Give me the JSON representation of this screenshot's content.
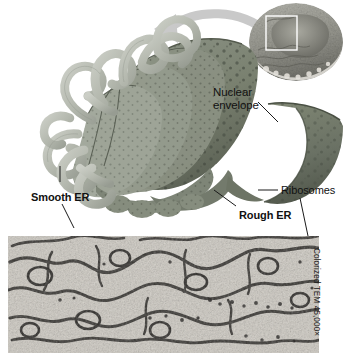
{
  "figure": {
    "background_color": "#ffffff",
    "labels": {
      "nuclear_envelope_line1": "Nuclear",
      "nuclear_envelope_line2": "envelope",
      "smooth_er": "Smooth ER",
      "rough_er": "Rough ER",
      "ribosomes": "Ribosomes"
    },
    "credit": "Colorized TEM 45,000×",
    "colors": {
      "rough_er_membrane": "#7d8477",
      "rough_er_shadow": "#5e665c",
      "smooth_er_tubule": "#b9bdb4",
      "nuclear_envelope": "#6b7368",
      "ribosome_dot": "#454b41",
      "arrow": "#c9c9c9",
      "inset_cell": "#9a9a93",
      "leader_line": "#1a1a1a",
      "micrograph_dark": "#2c2a28",
      "micrograph_light": "#d8d4cd"
    },
    "inset": {
      "name": "cell-overview-inset",
      "selection_box": "white rectangle marking magnified region"
    },
    "micrograph": {
      "name": "tem-micrograph",
      "description": "Colorized transmission electron micrograph of endoplasmic reticulum membranes"
    }
  }
}
